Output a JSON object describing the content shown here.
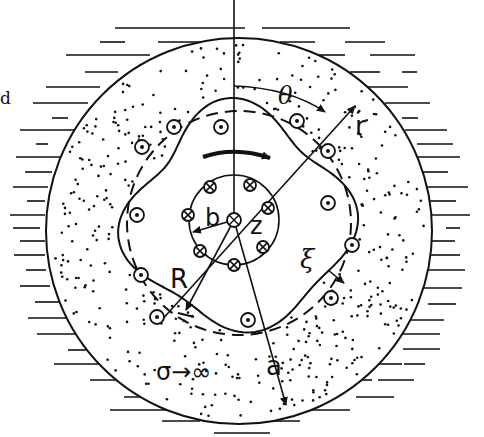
{
  "figure": {
    "type": "physics-diagram",
    "labels": {
      "fluid_edge": "d",
      "theta": "θ",
      "r": "r",
      "b": "b",
      "z": "z",
      "R": "R",
      "xi": "ξ",
      "a": "a",
      "sigma": "σ→∞"
    },
    "colors": {
      "ink": "#111111",
      "background": "#ffffff"
    },
    "outer_ring_conductor_count": 14,
    "inner_ring_conductor_count": 8
  }
}
